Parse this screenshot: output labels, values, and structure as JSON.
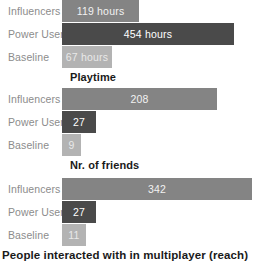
{
  "chart_data": [
    {
      "type": "bar",
      "orientation": "horizontal",
      "title": "Playtime",
      "xlabel": "",
      "ylabel": "",
      "categories": [
        "Influencers",
        "Power Users",
        "Baseline"
      ],
      "values": [
        119,
        454,
        67
      ],
      "value_labels": [
        "119 hours",
        "454 hours",
        "67 hours"
      ],
      "unit": "hours",
      "xlim": [
        0,
        470
      ],
      "grid": false,
      "legend": "none",
      "series_colors": [
        "#848484",
        "#4a4a4a",
        "#b3b3b3"
      ]
    },
    {
      "type": "bar",
      "orientation": "horizontal",
      "title": "Nr. of friends",
      "xlabel": "",
      "ylabel": "",
      "categories": [
        "Influencers",
        "Power Users",
        "Baseline"
      ],
      "values": [
        208,
        27,
        9
      ],
      "value_labels": [
        "208",
        "27",
        "9"
      ],
      "unit": "",
      "xlim": [
        0,
        215
      ],
      "grid": false,
      "legend": "none",
      "series_colors": [
        "#848484",
        "#4a4a4a",
        "#b3b3b3"
      ]
    },
    {
      "type": "bar",
      "orientation": "horizontal",
      "title": "People interacted with in multiplayer (reach)",
      "xlabel": "",
      "ylabel": "",
      "categories": [
        "Influencers",
        "Power Users",
        "Baseline"
      ],
      "values": [
        342,
        27,
        11
      ],
      "value_labels": [
        "342",
        "27",
        "11"
      ],
      "unit": "",
      "xlim": [
        0,
        350
      ],
      "grid": false,
      "legend": "none",
      "series_colors": [
        "#848484",
        "#4a4a4a",
        "#b3b3b3"
      ]
    }
  ],
  "bar_widths_px": [
    [
      77,
      172,
      50
    ],
    [
      155,
      34,
      19
    ],
    [
      190,
      34,
      24
    ]
  ],
  "colors": {
    "influencers": "#848484",
    "power_users": "#4a4a4a",
    "baseline": "#b3b3b3",
    "category_label": "#8c8c8c",
    "title": "#1a1a1a",
    "background": "#ffffff"
  }
}
